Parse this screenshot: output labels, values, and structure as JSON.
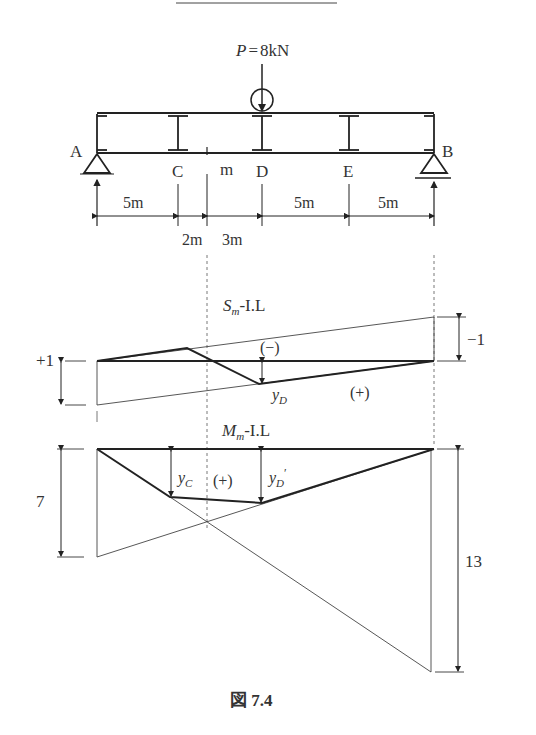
{
  "figure": {
    "caption": "図 7.4",
    "load": {
      "label": "P = 8kN",
      "symbol": "P",
      "value": "8kN"
    },
    "nodes": [
      {
        "id": "A",
        "label": "A"
      },
      {
        "id": "C",
        "label": "C"
      },
      {
        "id": "m",
        "label": "m"
      },
      {
        "id": "D",
        "label": "D"
      },
      {
        "id": "E",
        "label": "E"
      },
      {
        "id": "B",
        "label": "B"
      }
    ],
    "dimensions": {
      "top": [
        "5m",
        "5m",
        "5m"
      ],
      "bottom": [
        "2m",
        "3m"
      ]
    },
    "shear_il": {
      "title": "Sm-I.L",
      "title_main": "S",
      "title_sub": "m",
      "title_rest": "-I.L",
      "left_value": "+1",
      "right_value": "−1",
      "neg_region": "(−)",
      "pos_region": "(+)",
      "ordinate_label_main": "y",
      "ordinate_label_sub": "D"
    },
    "moment_il": {
      "title": "Mm-I.L",
      "title_main": "M",
      "title_sub": "m",
      "title_rest": "-I.L",
      "left_value": "7",
      "right_value": "13",
      "pos_region": "(+)",
      "yc_main": "y",
      "yc_sub": "C",
      "yd_main": "y",
      "yd_sub": "D",
      "yd_prime": "′"
    }
  }
}
